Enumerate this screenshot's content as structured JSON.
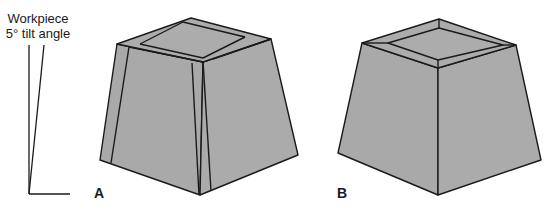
{
  "caption": {
    "line1": "Workpiece",
    "line2": "5° tilt angle"
  },
  "figures": [
    {
      "label": "A",
      "description": "Tapered block with strips on edges (pieces overlapped)"
    },
    {
      "label": "B",
      "description": "Tapered block with mitered top frame"
    }
  ],
  "angle_indicator": {
    "tilt_degrees": 5
  },
  "colors": {
    "fill": "#a8a8a8",
    "stroke": "#1a1a1a",
    "background": "#ffffff"
  }
}
